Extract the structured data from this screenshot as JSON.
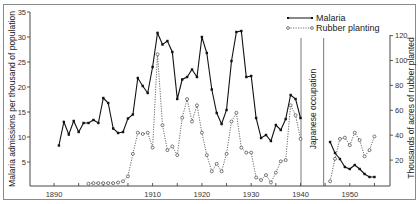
{
  "chart_data": {
    "type": "line",
    "title": "",
    "xlabel": "",
    "ylabel_left": "Malaria admissions per thousand of population",
    "ylabel_right": "Thousands of acres of rubber planted",
    "x_ticks": [
      1890,
      1910,
      1920,
      1930,
      1940,
      1950
    ],
    "y_left_ticks": [
      5,
      10,
      15,
      20,
      25,
      30,
      35
    ],
    "y_right_ticks": [
      20,
      40,
      60,
      80,
      100,
      120
    ],
    "xlim": [
      1887,
      1957
    ],
    "ylim_left": [
      0,
      35
    ],
    "ylim_right": [
      0,
      120
    ],
    "grid": false,
    "legend_position": "top-right",
    "annotation": "Japanese occupation",
    "occupation_span": [
      1940,
      1945
    ],
    "series": [
      {
        "name": "Malaria",
        "axis": "left",
        "style": "solid",
        "marker": "filled-square",
        "color": "#111111",
        "segments": [
          {
            "x": [
              1891,
              1892,
              1893,
              1894,
              1895,
              1896,
              1897,
              1898,
              1899,
              1900,
              1901,
              1902,
              1903,
              1904,
              1905,
              1906,
              1907,
              1908,
              1909,
              1910,
              1911,
              1912,
              1913,
              1914,
              1915,
              1916,
              1917,
              1918,
              1919,
              1920,
              1921,
              1922,
              1923,
              1924,
              1925,
              1926,
              1927,
              1928,
              1929,
              1930,
              1931,
              1932,
              1933,
              1934,
              1935,
              1936,
              1937,
              1938,
              1939,
              1940
            ],
            "y": [
              8.3,
              13,
              10.5,
              13.2,
              11,
              12.8,
              12.8,
              13.4,
              12.8,
              17.8,
              16.8,
              11.7,
              10.8,
              11,
              13.7,
              14.5,
              21.8,
              20.2,
              18.8,
              24,
              30.8,
              28.5,
              29.2,
              27,
              17.6,
              21.5,
              22,
              23.5,
              22,
              30,
              26.8,
              19.5,
              14.8,
              12.6,
              15.4,
              25.2,
              31,
              31.2,
              22,
              22.2,
              13.8,
              9.8,
              10.4,
              9.2,
              12.4,
              11.4,
              13.6,
              18.4,
              17.6,
              13.8
            ]
          },
          {
            "x": [
              1946,
              1947,
              1948,
              1949,
              1950,
              1951,
              1952,
              1953,
              1954,
              1955
            ],
            "y": [
              9,
              6.8,
              5.6,
              4,
              3.6,
              4.4,
              3.6,
              2.6,
              2,
              2
            ]
          }
        ]
      },
      {
        "name": "Rubber planting",
        "axis": "right",
        "style": "dotted",
        "marker": "open-circle",
        "color": "#444444",
        "segments": [
          {
            "x": [
              1897,
              1898,
              1899,
              1900,
              1901,
              1902,
              1903,
              1904,
              1905,
              1906,
              1907,
              1908,
              1909,
              1910,
              1911,
              1912,
              1913,
              1914,
              1915,
              1916,
              1917,
              1918,
              1919,
              1920,
              1921,
              1922,
              1923,
              1924,
              1925,
              1926,
              1927,
              1928,
              1929,
              1930,
              1931,
              1932,
              1933,
              1934,
              1935,
              1936,
              1937,
              1938,
              1939,
              1940
            ],
            "y": [
              1,
              1.5,
              1.5,
              1.5,
              1.5,
              1.5,
              2,
              3,
              7,
              25,
              42,
              41,
              42,
              30,
              105,
              48,
              28,
              31,
              24,
              54,
              69,
              51,
              64,
              42,
              24,
              11,
              17,
              11,
              25,
              51,
              58,
              30,
              26,
              26,
              6,
              4,
              8,
              2,
              10,
              19,
              20,
              64,
              56,
              37
            ]
          },
          {
            "x": [
              1946,
              1947,
              1948,
              1949,
              1950,
              1951,
              1952,
              1953,
              1954,
              1955
            ],
            "y": [
              3,
              21,
              37,
              38,
              32,
              42,
              36,
              23,
              28,
              39
            ]
          }
        ]
      }
    ]
  }
}
